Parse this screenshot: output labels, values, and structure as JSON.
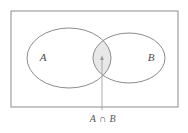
{
  "figure": {
    "name": "venn-diagram-intersection",
    "background_color": "#ffffff"
  },
  "universal_set": {
    "shape": "rectangle",
    "stroke_color": "#8c8c8c",
    "fill_color": "#ffffff",
    "x": 11,
    "y": 11,
    "width": 167,
    "height": 96
  },
  "sets": [
    {
      "id": "A",
      "label": "A",
      "shape": "ellipse",
      "cx": 69,
      "cy": 58,
      "rx": 42,
      "ry": 30,
      "label_x": 43,
      "label_y": 58,
      "stroke_color": "#8c8c8c",
      "fill_color": "none"
    },
    {
      "id": "B",
      "label": "B",
      "shape": "ellipse",
      "cx": 129,
      "cy": 58,
      "rx": 36,
      "ry": 25,
      "label_x": 151,
      "label_y": 58,
      "stroke_color": "#8c8c8c",
      "fill_color": "none"
    }
  ],
  "intersection": {
    "id": "A-intersect-B",
    "label": "A ∩ B",
    "shaded": true,
    "fill_color": "#e8e8e8",
    "stroke_color": "#8c8c8c",
    "center_x": 102,
    "center_y": 58
  },
  "leader": {
    "name": "leader-line",
    "stroke_color": "#9a9a9a",
    "from_x": 102,
    "from_y": 110,
    "to_x": 102,
    "to_y": 56,
    "arrowhead": "up"
  },
  "caption": {
    "text": "A ∩ B",
    "x": 103,
    "y": 120
  }
}
